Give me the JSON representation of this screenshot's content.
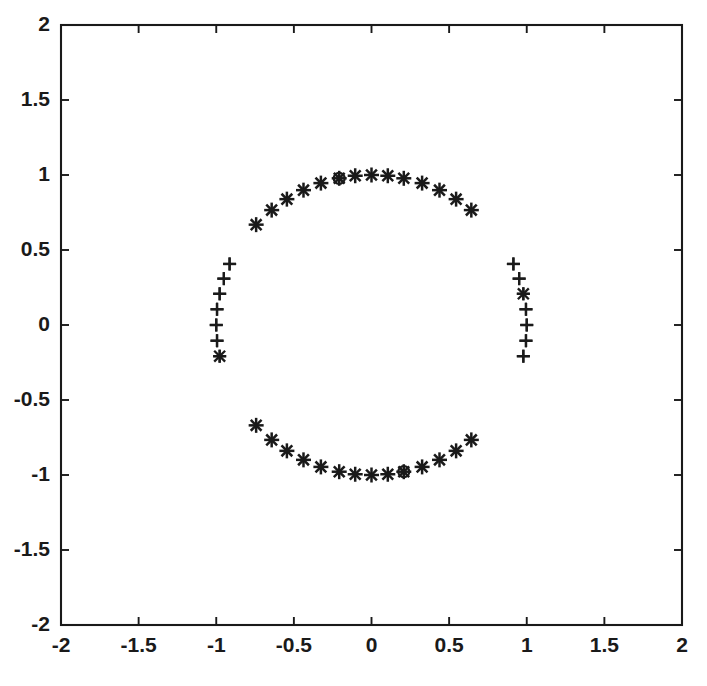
{
  "figure": {
    "background_color": "#ffffff",
    "axes_color": "#1a1a1a",
    "marker_color": "#1a1a1a",
    "box_on": true
  },
  "chart_data": {
    "type": "scatter",
    "title": "",
    "xlabel": "",
    "ylabel": "",
    "xlim": [
      -2,
      2
    ],
    "ylim": [
      -2,
      2
    ],
    "grid": false,
    "legend": null,
    "aspect_ratio": "equal",
    "xticks": [
      -2,
      -1.5,
      -1,
      -0.5,
      0,
      0.5,
      1,
      1.5,
      2
    ],
    "yticks": [
      -2,
      -1.5,
      -1,
      -0.5,
      0,
      0.5,
      1,
      1.5,
      2
    ],
    "xticklabels": [
      "-2",
      "-1.5",
      "-1",
      "-0.5",
      "0",
      "0.5",
      "1",
      "1.5",
      "2"
    ],
    "yticklabels": [
      "-2",
      "-1.5",
      "-1",
      "-0.5",
      "0",
      "0.5",
      "1",
      "1.5",
      "2"
    ],
    "series": [
      {
        "name": "plus-points",
        "marker": "+",
        "marker_size": 13,
        "count": 28,
        "x": [
          0.995,
          0.978,
          0.951,
          0.914,
          0.978,
          0.995,
          1.0,
          0.995,
          0.978,
          0.951,
          0.914,
          0.978,
          0.995,
          1.0,
          -0.995,
          -0.978,
          -0.951,
          -0.914,
          -0.978,
          -0.995,
          -1.0,
          -0.995,
          -0.978,
          -0.951,
          -0.914,
          -0.978,
          -0.995,
          -1.0
        ],
        "y": [
          0.105,
          0.208,
          0.309,
          0.407,
          -0.208,
          -0.105,
          0.0,
          0.105,
          0.208,
          0.309,
          0.407,
          -0.208,
          -0.105,
          0.0,
          0.105,
          0.208,
          0.309,
          0.407,
          -0.208,
          -0.105,
          0.0,
          0.105,
          0.208,
          0.309,
          0.407,
          -0.208,
          -0.105,
          0.0
        ]
      },
      {
        "name": "asterisk-points",
        "marker": "*",
        "marker_size": 15,
        "count": 28,
        "x": [
          0.643,
          0.545,
          0.438,
          0.326,
          0.208,
          0.105,
          0.0,
          -0.105,
          -0.208,
          -0.326,
          -0.438,
          -0.545,
          -0.643,
          -0.743,
          0.643,
          0.545,
          0.438,
          0.326,
          0.208,
          0.105,
          0.0,
          -0.105,
          -0.208,
          -0.326,
          -0.438,
          -0.545,
          -0.643,
          -0.743
        ],
        "y": [
          0.766,
          0.839,
          0.899,
          0.946,
          0.978,
          0.995,
          1.0,
          0.995,
          0.978,
          0.946,
          0.899,
          0.839,
          0.766,
          0.669,
          -0.766,
          -0.839,
          -0.899,
          -0.946,
          -0.978,
          -0.995,
          -1.0,
          -0.995,
          -0.978,
          -0.946,
          -0.899,
          -0.839,
          -0.766,
          -0.669
        ]
      },
      {
        "name": "cross-points",
        "marker": "x",
        "marker_size": 14,
        "count": 2,
        "x": [
          0.978,
          -0.978
        ],
        "y": [
          0.208,
          -0.208
        ]
      },
      {
        "name": "circle-points",
        "marker": "o",
        "marker_size": 11,
        "count": 2,
        "x": [
          -0.208,
          0.208
        ],
        "y": [
          0.978,
          -0.978
        ]
      }
    ],
    "all_points": {
      "angles_deg_step": 6,
      "radius": 1.0,
      "total_points": 60
    }
  }
}
